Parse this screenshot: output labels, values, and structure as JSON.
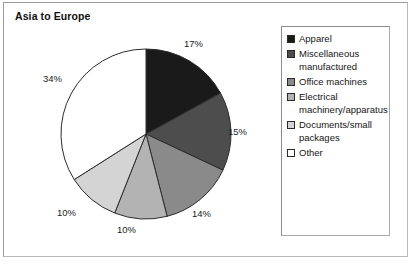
{
  "figure": {
    "title": "Asia to Europe",
    "width": 418,
    "height": 265,
    "background": "#ffffff",
    "frame_color": "#9a9a9a"
  },
  "chart_data": {
    "type": "pie",
    "title": "Asia to Europe",
    "xlabel": "",
    "ylabel": "",
    "grid": false,
    "legend_position": "right",
    "start_angle_deg": 0,
    "direction": "clockwise",
    "categories": [
      "Apparel",
      "Miscellaneous manufactured",
      "Office machines",
      "Electrical machinery/apparatus",
      "Documents/small packages",
      "Other"
    ],
    "values": [
      17,
      15,
      14,
      10,
      10,
      34
    ],
    "value_labels": [
      "17%",
      "15%",
      "14%",
      "10%",
      "10%",
      "34%"
    ],
    "unit": "%",
    "colors": [
      "#1a1a1a",
      "#4d4d4d",
      "#8a8a8a",
      "#b3b3b3",
      "#d4d4d4",
      "#ffffff"
    ],
    "slice_edge_color": "#2b2b2b"
  },
  "legend": {
    "entries": [
      {
        "label": "Apparel",
        "color": "#1a1a1a"
      },
      {
        "label": "Miscellaneous\nmanufactured",
        "color": "#4d4d4d"
      },
      {
        "label": "Office machines",
        "color": "#8a8a8a"
      },
      {
        "label": "Electrical\nmachinery/apparatus",
        "color": "#b3b3b3"
      },
      {
        "label": "Documents/small\npackages",
        "color": "#d4d4d4"
      },
      {
        "label": "Other",
        "color": "#ffffff"
      }
    ]
  },
  "labels": {
    "pct_17": "17%",
    "pct_15": "15%",
    "pct_14": "14%",
    "pct_10a": "10%",
    "pct_10b": "10%",
    "pct_34": "34%"
  }
}
